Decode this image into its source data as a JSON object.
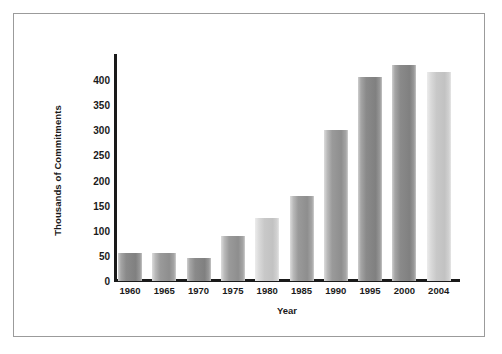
{
  "chart_data": {
    "type": "bar",
    "title": "",
    "xlabel": "Year",
    "ylabel": "Thousands of Commitments",
    "categories": [
      "1960",
      "1965",
      "1970",
      "1975",
      "1980",
      "1985",
      "1990",
      "1995",
      "2000",
      "2004"
    ],
    "values": [
      55,
      55,
      45,
      90,
      125,
      170,
      300,
      405,
      430,
      415
    ],
    "ylim": [
      0,
      450
    ],
    "yticks": [
      0,
      50,
      100,
      150,
      200,
      250,
      300,
      350,
      400
    ],
    "ytick_labels": [
      "0",
      "50",
      "100",
      "150",
      "200",
      "250",
      "300",
      "350",
      "400"
    ],
    "grid": false,
    "legend": null,
    "series": [
      {
        "name": "Thousands of Commitments",
        "values": [
          55,
          55,
          45,
          90,
          125,
          170,
          300,
          405,
          430,
          415
        ]
      }
    ],
    "bar_shades": [
      "dark",
      "mid",
      "dark",
      "mid",
      "light",
      "mid",
      "mid",
      "dark",
      "dark",
      "light"
    ],
    "colors": {
      "bar_mid": "#9a9a9a",
      "bar_dark": "#8a8a8a",
      "bar_light": "#c8c8c8",
      "axis": "#1a1a1a",
      "frame": "#9b9b9b",
      "background": "#ffffff"
    }
  }
}
